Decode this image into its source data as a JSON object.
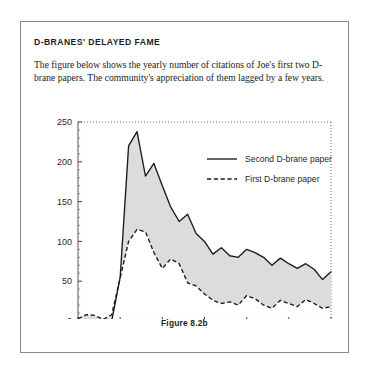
{
  "box": {
    "headline": "D-BRANES' DELAYED FAME",
    "body": "The figure below shows the yearly number of citations of Joe's first two D-brane papers. The community's appreciation of them lagged by a few years.",
    "caption": "Figure 8.2b"
  },
  "colors": {
    "line": "#1a1a1a",
    "fill": "#dcdcdc",
    "frame": "#8a8a8a",
    "text": "#1a1a1a",
    "page_background": "#ffffff"
  },
  "chart_data": {
    "type": "line",
    "title": "",
    "subtitle": "",
    "xlabel": "",
    "ylabel": "",
    "xlim": [
      1990,
      2020
    ],
    "ylim": [
      0,
      250
    ],
    "xticks": [
      1990,
      1995,
      2000,
      2005,
      2010,
      2015,
      2020
    ],
    "xtick_labels": [
      "1990",
      "1995",
      "2000",
      "2005",
      "2010",
      "2015",
      "2020"
    ],
    "yticks": [
      0,
      50,
      100,
      150,
      200,
      250
    ],
    "ytick_labels": [
      "0",
      "50",
      "100",
      "150",
      "200",
      "250"
    ],
    "minor_ticks": true,
    "grid": false,
    "frame": "dotted",
    "fill_between": true,
    "legend": {
      "position": "upper-right-inside",
      "entries": [
        {
          "label": "Second D-brane paper",
          "style": "solid"
        },
        {
          "label": "First D-brane paper",
          "style": "dashed"
        }
      ]
    },
    "x": [
      1990,
      1991,
      1992,
      1993,
      1994,
      1995,
      1996,
      1997,
      1998,
      1999,
      2000,
      2001,
      2002,
      2003,
      2004,
      2005,
      2006,
      2007,
      2008,
      2009,
      2010,
      2011,
      2012,
      2013,
      2014,
      2015,
      2016,
      2017,
      2018,
      2019,
      2020
    ],
    "series": [
      {
        "name": "Second D-brane paper",
        "style": "solid",
        "values": [
          0,
          0,
          0,
          0,
          0,
          55,
          220,
          238,
          182,
          198,
          170,
          143,
          125,
          134,
          110,
          100,
          84,
          92,
          82,
          80,
          90,
          86,
          80,
          70,
          79,
          72,
          66,
          72,
          65,
          52,
          62
        ]
      },
      {
        "name": "First D-brane paper",
        "style": "dashed",
        "values": [
          3,
          8,
          7,
          2,
          8,
          54,
          100,
          115,
          112,
          86,
          66,
          78,
          72,
          48,
          44,
          34,
          26,
          22,
          24,
          20,
          32,
          28,
          20,
          16,
          26,
          22,
          18,
          27,
          22,
          16,
          18
        ]
      }
    ]
  }
}
